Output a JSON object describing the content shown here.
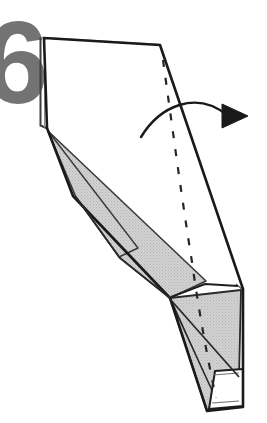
{
  "figure": {
    "kind": "origami-fold-diagram",
    "background_color": "#ffffff",
    "step_number": {
      "label": "6",
      "color": "#737373",
      "note": "large bold numeral, cropped at left edge of image"
    },
    "palette": {
      "outline": "#1a1a1a",
      "paper_front": "#ffffff",
      "paper_back_shaded": "#cccccc",
      "shade_edge": "#3a3a3a",
      "fold_line": "#262626",
      "arrow": "#1a1a1a"
    },
    "elements": {
      "white_panel_label": "front-of-paper panel",
      "shaded_panel_label": "reverse-side shaded panels",
      "fold_line_label": "valley fold line (dashed)",
      "arrow_label": "fold-over motion arrow",
      "edge_label": "paper layered edge"
    },
    "geometry": {
      "main_outline": "44,38 160,45 243,288 243,408 206,412 170,298 73,196 47,128",
      "top_panel": "47,48 158,50 236,284 203,286 171,297 75,196 49,130",
      "layer_edge_left": "40,38 40,126 47,128",
      "shaded_left_wedge": "48,132 136,246 80,200 74,196",
      "shaded_band": "48,132 205,281 170,298 120,258 76,197",
      "shaded_lower_triangle": "170,298 240,292 238,380 215,400",
      "shaded_bottom_wedge": "170,298 215,400 206,410 172,302",
      "white_bottom_flap": "214,372 243,370 243,407 209,409",
      "fold_dash": "163,60 178,178 192,262 206,340 216,398",
      "arrow_curve_start": "142,136",
      "arrow_curve_control": "190,92",
      "arrow_curve_end": "226,116",
      "arrow_head_tip": "247,116"
    }
  }
}
